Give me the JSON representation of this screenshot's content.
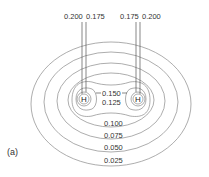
{
  "figure": {
    "panel_label": "(a)",
    "atoms": [
      {
        "symbol": "H",
        "x": 84,
        "y": 99
      },
      {
        "symbol": "H",
        "x": 138,
        "y": 99
      }
    ],
    "top_labels": [
      {
        "text": "0.200",
        "x": 64,
        "y": 19
      },
      {
        "text": "0.175",
        "x": 86,
        "y": 19
      },
      {
        "text": "0.175",
        "x": 120,
        "y": 19
      },
      {
        "text": "0.200",
        "x": 142,
        "y": 19
      }
    ],
    "center_labels": [
      {
        "text": "0.150",
        "x": 102,
        "y": 95
      },
      {
        "text": "0.125",
        "x": 102,
        "y": 104
      }
    ],
    "lower_labels": [
      {
        "text": "0.100",
        "x": 104,
        "y": 124
      },
      {
        "text": "0.075",
        "x": 104,
        "y": 135
      },
      {
        "text": "0.050",
        "x": 104,
        "y": 147
      },
      {
        "text": "0.025",
        "x": 104,
        "y": 161
      }
    ],
    "contour_values": [
      "0.200",
      "0.175",
      "0.150",
      "0.125",
      "0.100",
      "0.075",
      "0.050",
      "0.025"
    ],
    "line_color": "#8a8a8a"
  }
}
